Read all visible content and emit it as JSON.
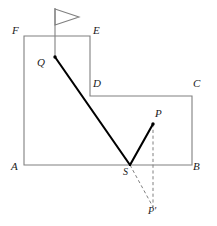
{
  "figure": {
    "canvas": {
      "width": 217,
      "height": 226,
      "background": "#ffffff"
    },
    "colors": {
      "outline": "#808080",
      "ray": "#000000",
      "dashed": "#808080",
      "label": "#1a1a1a",
      "flag": "#808080"
    },
    "labels": {
      "A": "A",
      "B": "B",
      "C": "C",
      "D": "D",
      "E": "E",
      "F": "F",
      "P": "P",
      "P_prime": "P'",
      "Q": "Q",
      "S": "S"
    },
    "geometry": {
      "polygon_points": "24,36 90,36 90,96 192,96 192,165 24,165",
      "vertices": {
        "A": {
          "x": 24,
          "y": 165
        },
        "B": {
          "x": 192,
          "y": 165
        },
        "C": {
          "x": 192,
          "y": 96
        },
        "D": {
          "x": 90,
          "y": 96
        },
        "E": {
          "x": 90,
          "y": 36
        },
        "F": {
          "x": 24,
          "y": 36
        }
      },
      "points": {
        "Q": {
          "x": 55,
          "y": 57
        },
        "S": {
          "x": 130,
          "y": 165
        },
        "P": {
          "x": 153,
          "y": 124
        },
        "P_prime": {
          "x": 153,
          "y": 207
        }
      },
      "flag": {
        "pole_top": {
          "x": 55,
          "y": 8
        },
        "pole_bottom": {
          "x": 55,
          "y": 57
        },
        "banner": "55,9 79,17 55,25"
      },
      "segments": {
        "incident_ray": {
          "from": "Q",
          "to": "S",
          "style": "solid-thick"
        },
        "reflected_ray": {
          "from": "S",
          "to": "P",
          "style": "solid-thick"
        },
        "virtual_ray": {
          "from": "S",
          "to": "P_prime",
          "style": "dashed"
        },
        "mirror_drop": {
          "from": "P",
          "to": "P_prime",
          "style": "dashed"
        }
      }
    },
    "label_positions": {
      "A": {
        "x": 11,
        "y": 168
      },
      "B": {
        "x": 194,
        "y": 168
      },
      "C": {
        "x": 194,
        "y": 81
      },
      "D": {
        "x": 93,
        "y": 81
      },
      "E": {
        "x": 93,
        "y": 22
      },
      "F": {
        "x": 11,
        "y": 22
      },
      "P": {
        "x": 155,
        "y": 110
      },
      "P_prime": {
        "x": 149,
        "y": 209
      },
      "Q": {
        "x": 38,
        "y": 57
      },
      "S": {
        "x": 124,
        "y": 168
      }
    }
  }
}
